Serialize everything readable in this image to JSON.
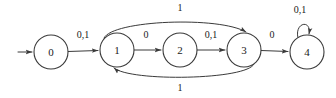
{
  "diagram": {
    "type": "state-transition-diagram",
    "stroke_color": "#3a3a3a",
    "text_color": "#1a1a1a",
    "background_color": "#ffffff",
    "states": [
      {
        "id": "0",
        "label": "0",
        "cx": 51,
        "cy": 52,
        "r": 17,
        "is_start": true,
        "is_accept": false
      },
      {
        "id": "1",
        "label": "1",
        "cx": 117,
        "cy": 50,
        "r": 17,
        "is_start": false,
        "is_accept": false
      },
      {
        "id": "2",
        "label": "2",
        "cx": 180,
        "cy": 50,
        "r": 17,
        "is_start": false,
        "is_accept": false
      },
      {
        "id": "3",
        "label": "3",
        "cx": 244,
        "cy": 50,
        "r": 17,
        "is_start": false,
        "is_accept": false
      },
      {
        "id": "4",
        "label": "4",
        "cx": 307,
        "cy": 52,
        "r": 17,
        "is_start": false,
        "is_accept": false
      }
    ],
    "start_arrow": {
      "label": "",
      "from_x": 18,
      "to_x": 33,
      "y": 52
    },
    "transitions": [
      {
        "from": "0",
        "to": "1",
        "label": "0,1",
        "label_x": 83,
        "label_y": 36,
        "shape": "straight"
      },
      {
        "from": "1",
        "to": "2",
        "label": "0",
        "label_x": 146,
        "label_y": 36,
        "shape": "straight"
      },
      {
        "from": "2",
        "to": "3",
        "label": "0,1",
        "label_x": 211,
        "label_y": 36,
        "shape": "straight"
      },
      {
        "from": "3",
        "to": "4",
        "label": "0",
        "label_x": 272,
        "label_y": 36,
        "shape": "straight"
      },
      {
        "from": "1",
        "to": "3",
        "label": "1",
        "label_x": 180,
        "label_y": 9,
        "shape": "curve-above"
      },
      {
        "from": "3",
        "to": "1",
        "label": "1",
        "label_x": 180,
        "label_y": 89,
        "shape": "curve-below"
      },
      {
        "from": "4",
        "to": "4",
        "label": "0,1",
        "label_x": 300,
        "label_y": 11,
        "shape": "self-loop"
      }
    ]
  }
}
